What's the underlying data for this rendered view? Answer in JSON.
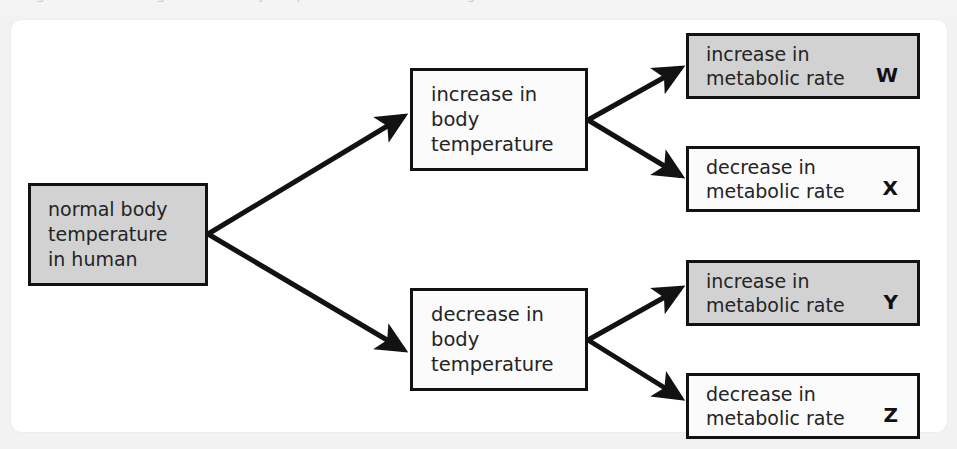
{
  "page": {
    "background_color": "#f2f2f2",
    "card_background": "#ffffff",
    "clipped_header_text": "Figure shows the regulation of body temperature in a human being."
  },
  "diagram": {
    "type": "flow-diagram",
    "shaded_fill": "#d2d2d2",
    "plain_fill": "#fbfbfb",
    "border_color": "#121212",
    "arrow_color": "#121212",
    "root": {
      "id": "normal",
      "label": "normal body\ntemperature\nin human",
      "shaded": true
    },
    "stages": [
      {
        "id": "increase-temp",
        "label": "increase in body\ntemperature",
        "shaded": false,
        "outcomes": [
          {
            "id": "w",
            "label": "increase in\nmetabolic rate",
            "key": "W",
            "shaded": true
          },
          {
            "id": "x",
            "label": "decrease in\nmetabolic rate",
            "key": "X",
            "shaded": false
          }
        ]
      },
      {
        "id": "decrease-temp",
        "label": "decrease in body\ntemperature",
        "shaded": false,
        "outcomes": [
          {
            "id": "y",
            "label": "increase in\nmetabolic rate",
            "key": "Y",
            "shaded": true
          },
          {
            "id": "z",
            "label": "decrease in\nmetabolic rate",
            "key": "Z",
            "shaded": false
          }
        ]
      }
    ],
    "arrows": [
      {
        "id": "root-to-increase",
        "from": "normal",
        "to": "increase-temp"
      },
      {
        "id": "root-to-decrease",
        "from": "normal",
        "to": "decrease-temp"
      },
      {
        "id": "increase-to-w",
        "from": "increase-temp",
        "to": "w"
      },
      {
        "id": "increase-to-x",
        "from": "increase-temp",
        "to": "x"
      },
      {
        "id": "decrease-to-y",
        "from": "decrease-temp",
        "to": "y"
      },
      {
        "id": "decrease-to-z",
        "from": "decrease-temp",
        "to": "z"
      }
    ]
  }
}
